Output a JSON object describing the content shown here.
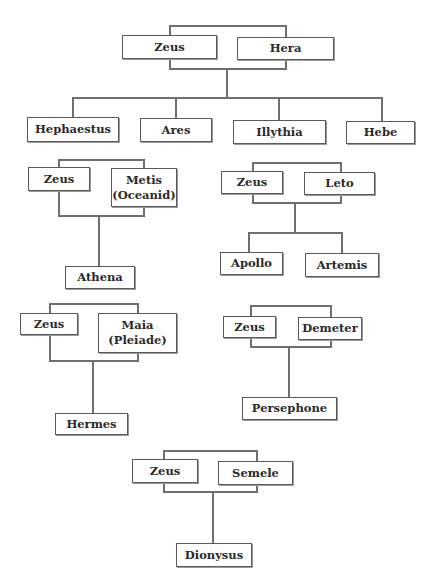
{
  "diagram": {
    "type": "family-tree",
    "families": [
      {
        "parents": [
          "Zeus",
          "Hera"
        ],
        "children": [
          "Hephaestus",
          "Ares",
          "Illythia",
          "Hebe"
        ]
      },
      {
        "parents": [
          "Zeus",
          "Metis (Oceanid)"
        ],
        "parent2_lines": [
          "Metis",
          "(Oceanid)"
        ],
        "children": [
          "Athena"
        ]
      },
      {
        "parents": [
          "Zeus",
          "Leto"
        ],
        "children": [
          "Apollo",
          "Artemis"
        ]
      },
      {
        "parents": [
          "Zeus",
          "Maia (Pleiade)"
        ],
        "parent2_lines": [
          "Maia",
          "(Pleiade)"
        ],
        "children": [
          "Hermes"
        ]
      },
      {
        "parents": [
          "Zeus",
          "Demeter"
        ],
        "children": [
          "Persephone"
        ]
      },
      {
        "parents": [
          "Zeus",
          "Semele"
        ],
        "children": [
          "Dionysus"
        ]
      }
    ]
  },
  "colors": {
    "line": "#6f6f6f",
    "box_border": "#5a5a5a",
    "text": "#2a2a2a",
    "background": "#ffffff"
  }
}
